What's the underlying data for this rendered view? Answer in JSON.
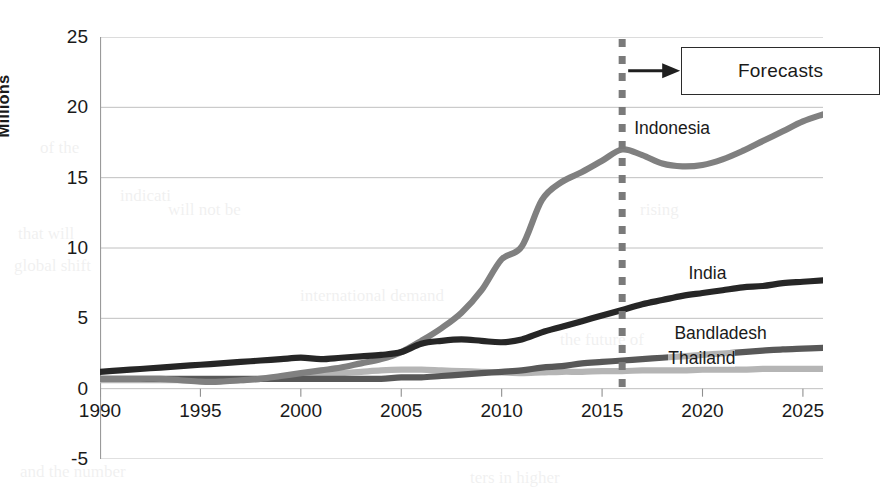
{
  "chart_data": {
    "type": "line",
    "title": "",
    "xlabel": "",
    "ylabel": "Millions",
    "xlim": [
      1990,
      2026
    ],
    "ylim": [
      -5,
      25
    ],
    "ytick_labels": [
      "25",
      "20",
      "15",
      "10",
      "5",
      "0",
      "-5"
    ],
    "ytick_values": [
      25,
      20,
      15,
      10,
      5,
      0,
      -5
    ],
    "xtick_labels": [
      "1990",
      "1995",
      "2000",
      "2005",
      "2010",
      "2015",
      "2020",
      "2025"
    ],
    "xtick_values": [
      1990,
      1995,
      2000,
      2005,
      2010,
      2015,
      2020,
      2025
    ],
    "grid": "horizontal",
    "legend_position": "inline-labels-right",
    "annotations": [
      {
        "text": "Forecasts",
        "kind": "boxed-callout-with-arrow",
        "points_to_x": 2016
      }
    ],
    "forecast_divider": {
      "x": 2016,
      "style": "dashed",
      "color": "#7a7a7a"
    },
    "x": [
      1990,
      1991,
      1992,
      1993,
      1994,
      1995,
      1996,
      1997,
      1998,
      1999,
      2000,
      2001,
      2002,
      2003,
      2004,
      2005,
      2006,
      2007,
      2008,
      2009,
      2010,
      2011,
      2012,
      2013,
      2014,
      2015,
      2016,
      2017,
      2018,
      2019,
      2020,
      2021,
      2022,
      2023,
      2024,
      2025,
      2026
    ],
    "series": [
      {
        "name": "Indonesia",
        "label": "Indonesia",
        "color": "#808080",
        "values": [
          0.7,
          0.7,
          0.7,
          0.7,
          0.6,
          0.5,
          0.5,
          0.6,
          0.7,
          0.9,
          1.1,
          1.3,
          1.5,
          1.8,
          2.1,
          2.6,
          3.4,
          4.3,
          5.4,
          7.0,
          9.2,
          10.1,
          13.4,
          14.7,
          15.4,
          16.2,
          17.0,
          16.6,
          16.0,
          15.8,
          15.9,
          16.3,
          16.9,
          17.6,
          18.3,
          19.0,
          19.5
        ]
      },
      {
        "name": "India",
        "label": "India",
        "color": "#262626",
        "values": [
          1.2,
          1.3,
          1.4,
          1.5,
          1.6,
          1.7,
          1.8,
          1.9,
          2.0,
          2.1,
          2.2,
          2.1,
          2.2,
          2.3,
          2.4,
          2.6,
          3.2,
          3.4,
          3.5,
          3.4,
          3.3,
          3.5,
          4.0,
          4.4,
          4.8,
          5.2,
          5.6,
          6.0,
          6.3,
          6.6,
          6.8,
          7.0,
          7.2,
          7.3,
          7.5,
          7.6,
          7.7
        ]
      },
      {
        "name": "Bandladesh",
        "label": "Bandladesh",
        "color": "#585858",
        "values": [
          0.7,
          0.7,
          0.7,
          0.7,
          0.7,
          0.7,
          0.7,
          0.7,
          0.7,
          0.7,
          0.7,
          0.7,
          0.7,
          0.7,
          0.7,
          0.8,
          0.8,
          0.9,
          1.0,
          1.1,
          1.2,
          1.3,
          1.5,
          1.6,
          1.8,
          1.9,
          2.0,
          2.1,
          2.2,
          2.3,
          2.4,
          2.5,
          2.6,
          2.7,
          2.8,
          2.85,
          2.9
        ]
      },
      {
        "name": "Thailand",
        "label": "Thailand",
        "color": "#b5b5b5",
        "values": [
          0.6,
          0.6,
          0.6,
          0.6,
          0.6,
          0.6,
          0.6,
          0.6,
          0.7,
          0.8,
          0.9,
          1.0,
          1.1,
          1.2,
          1.3,
          1.35,
          1.35,
          1.3,
          1.25,
          1.2,
          1.15,
          1.1,
          1.15,
          1.2,
          1.2,
          1.25,
          1.25,
          1.3,
          1.3,
          1.3,
          1.35,
          1.35,
          1.35,
          1.4,
          1.4,
          1.4,
          1.4
        ]
      }
    ]
  },
  "axis": {
    "y_title": "Millions"
  },
  "ghost_text": [
    {
      "text": "of the",
      "x": 40,
      "y": 138
    },
    {
      "text": "indicati",
      "x": 120,
      "y": 186
    },
    {
      "text": "that will",
      "x": 18,
      "y": 224
    },
    {
      "text": "global shift",
      "x": 14,
      "y": 256
    },
    {
      "text": "international demand",
      "x": 300,
      "y": 286
    },
    {
      "text": "will not be",
      "x": 168,
      "y": 200
    },
    {
      "text": "the future of",
      "x": 560,
      "y": 330
    },
    {
      "text": "and the number",
      "x": 20,
      "y": 462
    },
    {
      "text": "ters in higher",
      "x": 470,
      "y": 468
    },
    {
      "text": "rising",
      "x": 640,
      "y": 200
    }
  ]
}
